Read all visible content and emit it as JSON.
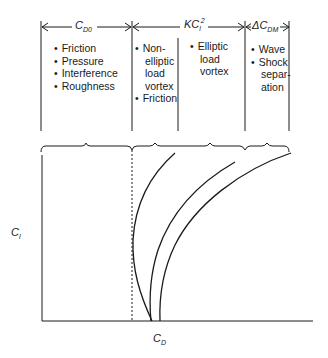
{
  "header": {
    "col1_symbol": "C",
    "col1_sub": "D0",
    "col2_symbol": "KC",
    "col2_sub": "l",
    "col2_sup": "2",
    "col3_symbol": "ΔC",
    "col3_sub": "DM"
  },
  "columns": [
    {
      "items": [
        "Friction",
        "Pressure",
        "Interference",
        "Roughness"
      ]
    },
    {
      "items": [
        "Non-",
        "elliptic",
        "load",
        "vortex",
        "Friction"
      ]
    },
    {
      "items": [
        "Elliptic",
        "load",
        "vortex"
      ]
    },
    {
      "items": [
        "Wave",
        "Shock",
        "separ-",
        "ation"
      ]
    }
  ],
  "axes": {
    "y_symbol": "C",
    "y_sub": "l",
    "x_symbol": "C",
    "x_sub": "D"
  },
  "colors": {
    "line": "#1a1a1a",
    "background": "#ffffff"
  }
}
